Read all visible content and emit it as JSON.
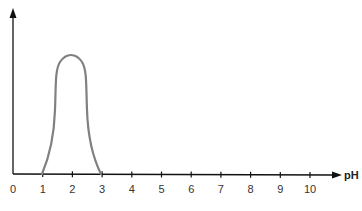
{
  "chart_data": {
    "type": "line",
    "title": "",
    "xlabel": "pH",
    "ylabel": "",
    "xlim": [
      0,
      10.9
    ],
    "x_ticks": [
      "0",
      "1",
      "2",
      "3",
      "4",
      "5",
      "6",
      "7",
      "8",
      "9",
      "10"
    ],
    "grid": false,
    "legend": null,
    "series": [
      {
        "name": "activity",
        "color": "#808080",
        "x": [
          1.0,
          1.2,
          1.4,
          1.5,
          1.6,
          1.8,
          2.0,
          2.2,
          2.4,
          2.5,
          2.6,
          2.8,
          3.0
        ],
        "y": [
          0.0,
          0.25,
          0.6,
          0.82,
          0.93,
          0.99,
          1.0,
          0.99,
          0.93,
          0.82,
          0.6,
          0.25,
          0.0
        ]
      }
    ],
    "y_axis_ticks": []
  },
  "axes": {
    "x_label": "pH",
    "tick_labels": [
      "0",
      "1",
      "2",
      "3",
      "4",
      "5",
      "6",
      "7",
      "8",
      "9",
      "10"
    ]
  }
}
